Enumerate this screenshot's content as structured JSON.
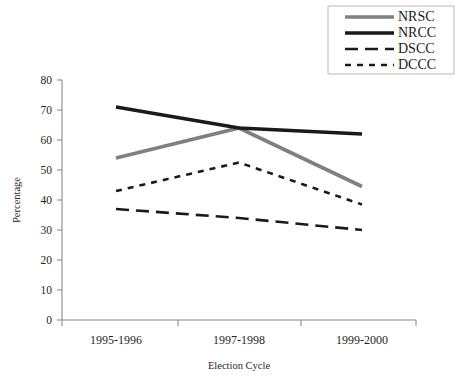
{
  "chart_data": {
    "type": "line",
    "title": "",
    "xlabel": "Election Cycle",
    "ylabel": "Percentage",
    "categories": [
      "1995-1996",
      "1997-1998",
      "1999-2000"
    ],
    "ylim": [
      0,
      80
    ],
    "yticks": [
      0,
      10,
      20,
      30,
      40,
      50,
      60,
      70,
      80
    ],
    "ytick_labels": [
      "0",
      "10",
      "20",
      "30",
      "40",
      "50",
      "60",
      "70",
      "80"
    ],
    "grid": false,
    "legend_position": "top-right",
    "series": [
      {
        "name": "NRSC",
        "values": [
          54,
          64,
          44.5
        ],
        "color": "#808080",
        "style": "solid",
        "width": 3.6
      },
      {
        "name": "NRCC",
        "values": [
          71,
          64,
          62
        ],
        "color": "#1a1a1a",
        "style": "solid",
        "width": 3.6
      },
      {
        "name": "DSCC",
        "values": [
          37,
          34,
          30
        ],
        "color": "#1a1a1a",
        "style": "dashed",
        "width": 2.6,
        "dasharray": "13,7"
      },
      {
        "name": "DCCC",
        "values": [
          43,
          52.5,
          38.5
        ],
        "color": "#1a1a1a",
        "style": "dotted",
        "width": 2.6,
        "dasharray": "6,6"
      }
    ]
  },
  "legend": {
    "entries": [
      "NRSC",
      "NRCC",
      "DSCC",
      "DCCC"
    ]
  },
  "axes": {
    "y_title": "Percentage",
    "x_title": "Election Cycle"
  },
  "artifact": {
    "top_strip": "· · ·· · · ·· · ·· · · · ·· · ·"
  }
}
